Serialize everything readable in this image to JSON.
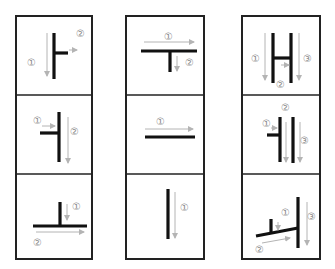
{
  "diagram": {
    "colors": {
      "stroke": "#111111",
      "arrow": "#b4b4b4",
      "label": "#8a8a8a",
      "border": "#222222"
    },
    "columns": [
      {
        "name": "left",
        "cells": [
          {
            "name": "vertical-with-right-stub",
            "labels": [
              "①",
              "②"
            ]
          },
          {
            "name": "vertical-with-left-stub",
            "labels": [
              "①",
              "②"
            ]
          },
          {
            "name": "inverted-t",
            "labels": [
              "①",
              "②"
            ]
          }
        ]
      },
      {
        "name": "middle",
        "cells": [
          {
            "name": "t-shape",
            "labels": [
              "①",
              "②"
            ]
          },
          {
            "name": "horizontal-line",
            "labels": [
              "①"
            ]
          },
          {
            "name": "vertical-line",
            "labels": [
              "①"
            ]
          }
        ]
      },
      {
        "name": "right",
        "cells": [
          {
            "name": "h-shape",
            "labels": [
              "①",
              "②",
              "③"
            ]
          },
          {
            "name": "stub-and-two-verticals",
            "labels": [
              "①",
              "②",
              "③"
            ]
          },
          {
            "name": "slanted-combination",
            "labels": [
              "①",
              "②",
              "③"
            ]
          }
        ]
      }
    ]
  }
}
